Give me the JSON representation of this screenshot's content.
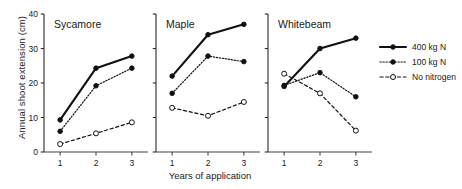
{
  "figure": {
    "ylabel": "Annual shoot extension (cm)",
    "xlabel": "Years of application"
  },
  "axis": {
    "y_ticks": [
      "0",
      "10",
      "20",
      "30",
      "40"
    ],
    "x_ticks": [
      "1",
      "2",
      "3"
    ]
  },
  "panels": [
    {
      "title": "Sycamore"
    },
    {
      "title": "Maple"
    },
    {
      "title": "Whitebeam"
    }
  ],
  "legend": {
    "items": [
      {
        "label": "400 kg N"
      },
      {
        "label": "100 kg N"
      },
      {
        "label": "No nitrogen"
      }
    ]
  },
  "chart_data": {
    "type": "line",
    "title": "",
    "xlabel": "Years of application",
    "ylabel": "Annual shoot extension (cm)",
    "x": [
      1,
      2,
      3
    ],
    "xlim": [
      0.55,
      3.45
    ],
    "ylim": [
      0,
      40
    ],
    "yticks": [
      0,
      10,
      20,
      30,
      40
    ],
    "grid": false,
    "legend_position": "right",
    "panels": [
      {
        "title": "Sycamore",
        "categories": [
          1,
          2,
          3
        ],
        "series": [
          {
            "name": "400 kg N",
            "values": [
              9.3,
              24.3,
              27.8
            ],
            "line": "solid",
            "marker": "filled-circle"
          },
          {
            "name": "100 kg N",
            "values": [
              6.0,
              19.2,
              24.3
            ],
            "line": "dotted",
            "marker": "filled-circle"
          },
          {
            "name": "No nitrogen",
            "values": [
              2.3,
              5.4,
              8.6
            ],
            "line": "dashed",
            "marker": "open-circle"
          }
        ]
      },
      {
        "title": "Maple",
        "categories": [
          1,
          2,
          3
        ],
        "series": [
          {
            "name": "400 kg N",
            "values": [
              22.0,
              34.0,
              37.0
            ],
            "line": "solid",
            "marker": "filled-circle"
          },
          {
            "name": "100 kg N",
            "values": [
              17.0,
              27.8,
              26.2
            ],
            "line": "dotted",
            "marker": "filled-circle"
          },
          {
            "name": "No nitrogen",
            "values": [
              12.8,
              10.5,
              14.5
            ],
            "line": "dashed",
            "marker": "open-circle"
          }
        ]
      },
      {
        "title": "Whitebeam",
        "categories": [
          1,
          2,
          3
        ],
        "series": [
          {
            "name": "400 kg N",
            "values": [
              19.0,
              30.0,
              33.0
            ],
            "line": "solid",
            "marker": "filled-circle"
          },
          {
            "name": "100 kg N",
            "values": [
              19.3,
              23.0,
              16.0
            ],
            "line": "dotted",
            "marker": "filled-circle"
          },
          {
            "name": "No nitrogen",
            "values": [
              22.7,
              17.0,
              6.2
            ],
            "line": "dashed",
            "marker": "open-circle"
          }
        ]
      }
    ]
  }
}
